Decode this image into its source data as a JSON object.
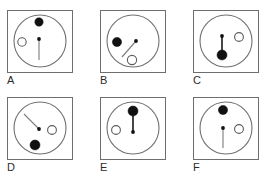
{
  "figure": {
    "title": "",
    "type": "multi-panel-diagram",
    "panel_count": 6,
    "columns": 3,
    "rows": 2,
    "canvas": {
      "width": 269,
      "height": 189
    },
    "colors": {
      "box_stroke": "#6e6e6e",
      "dial_stroke": "#707070",
      "filled_dot": "#111111",
      "open_dot_stroke": "#5d5d5d",
      "background": "#ffffff",
      "label_text": "#2b2b2b",
      "hand_light": "#808080",
      "hand_dark": "#1a1a1a"
    }
  },
  "panels": [
    {
      "label": "A",
      "position": {
        "left": 7,
        "top": 10
      },
      "dial": {
        "cx": 33,
        "cy": 31,
        "r": 26
      },
      "hub": {
        "cx": 32,
        "cy": 29,
        "r": 1.9
      },
      "hand": {
        "x1": 32,
        "y1": 29,
        "x2": 32,
        "y2": 50,
        "style": "light"
      },
      "filled_dot": {
        "cx": 32,
        "cy": 12,
        "r": 4.2
      },
      "open_dot": {
        "cx": 15,
        "cy": 32,
        "r": 4.2
      }
    },
    {
      "label": "B",
      "position": {
        "left": 100,
        "top": 10
      },
      "dial": {
        "cx": 33,
        "cy": 31,
        "r": 26
      },
      "hub": {
        "cx": 36,
        "cy": 31,
        "r": 1.9
      },
      "hand": {
        "x1": 36,
        "y1": 31,
        "x2": 22,
        "y2": 47,
        "style": "light"
      },
      "filled_dot": {
        "cx": 17,
        "cy": 32,
        "r": 4.6
      },
      "open_dot": {
        "cx": 32,
        "cy": 50,
        "r": 4.6
      }
    },
    {
      "label": "C",
      "position": {
        "left": 193,
        "top": 10
      },
      "dial": {
        "cx": 33,
        "cy": 31,
        "r": 26
      },
      "hub": {
        "cx": 29,
        "cy": 26,
        "r": 1.9
      },
      "hand": {
        "x1": 29,
        "y1": 26,
        "x2": 29,
        "y2": 42,
        "style": "dark"
      },
      "filled_dot": {
        "cx": 29,
        "cy": 45,
        "r": 5.0
      },
      "open_dot": {
        "cx": 46,
        "cy": 27,
        "r": 4.4
      }
    },
    {
      "label": "D",
      "position": {
        "left": 7,
        "top": 97
      },
      "dial": {
        "cx": 33,
        "cy": 31,
        "r": 26
      },
      "hub": {
        "cx": 32,
        "cy": 32,
        "r": 1.9
      },
      "hand": {
        "x1": 32,
        "y1": 32,
        "x2": 17,
        "y2": 17,
        "style": "light"
      },
      "filled_dot": {
        "cx": 28,
        "cy": 48,
        "r": 5.0
      },
      "open_dot": {
        "cx": 45,
        "cy": 33,
        "r": 4.4
      }
    },
    {
      "label": "E",
      "position": {
        "left": 100,
        "top": 97
      },
      "dial": {
        "cx": 33,
        "cy": 31,
        "r": 26
      },
      "hub": {
        "cx": 33,
        "cy": 35,
        "r": 1.9
      },
      "hand": {
        "x1": 33,
        "y1": 35,
        "x2": 33,
        "y2": 18,
        "style": "dark"
      },
      "filled_dot": {
        "cx": 33,
        "cy": 14,
        "r": 5.0
      },
      "open_dot": {
        "cx": 16,
        "cy": 33,
        "r": 4.4
      }
    },
    {
      "label": "F",
      "position": {
        "left": 193,
        "top": 97
      },
      "dial": {
        "cx": 33,
        "cy": 31,
        "r": 26
      },
      "hub": {
        "cx": 30,
        "cy": 31,
        "r": 1.9
      },
      "hand": {
        "x1": 30,
        "y1": 31,
        "x2": 30,
        "y2": 51,
        "style": "light"
      },
      "filled_dot": {
        "cx": 30,
        "cy": 13,
        "r": 4.6
      },
      "open_dot": {
        "cx": 46,
        "cy": 32,
        "r": 4.4
      }
    }
  ]
}
